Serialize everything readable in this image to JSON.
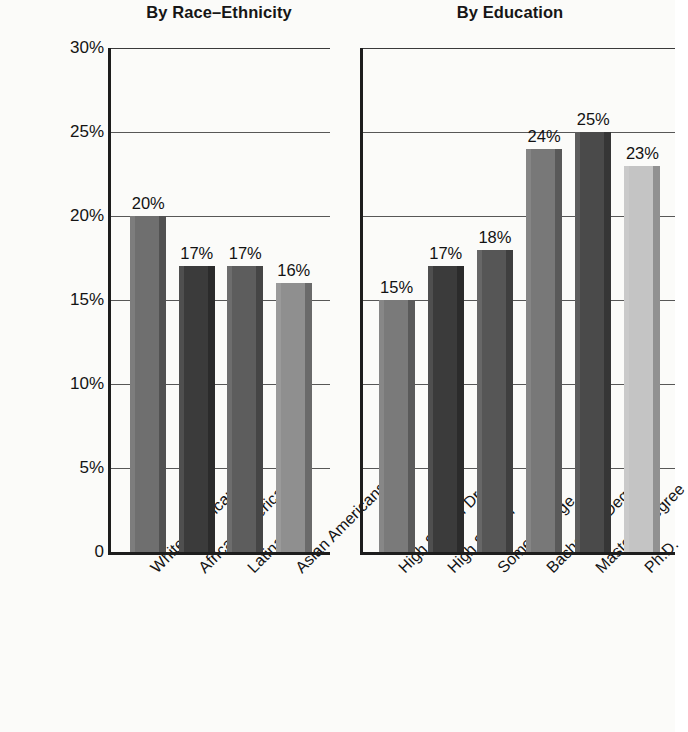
{
  "chart_data": [
    {
      "type": "bar",
      "title": "By Race–Ethnicity",
      "xlabel": "",
      "ylabel": "",
      "ylim": [
        0,
        30
      ],
      "grid": true,
      "legend": "none",
      "ytick_labels": [
        "0",
        "5%",
        "10%",
        "15%",
        "20%",
        "25%",
        "30%"
      ],
      "ytick_values": [
        0,
        5,
        10,
        15,
        20,
        25,
        30
      ],
      "categories": [
        "White Americans",
        "African Americans",
        "Latinas",
        "Asian Americans"
      ],
      "values": [
        20,
        17,
        17,
        16
      ],
      "value_labels": [
        "20%",
        "17%",
        "17%",
        "16%"
      ],
      "bar_colors": [
        "#6f6f6f",
        "#3b3b3b",
        "#5d5d5d",
        "#8f8f8f"
      ]
    },
    {
      "type": "bar",
      "title": "By Education",
      "xlabel": "",
      "ylabel": "",
      "ylim": [
        0,
        30
      ],
      "grid": true,
      "legend": "none",
      "ytick_labels": [
        "0",
        "5%",
        "10%",
        "15%",
        "20%",
        "25%",
        "30%"
      ],
      "ytick_values": [
        0,
        5,
        10,
        15,
        20,
        25,
        30
      ],
      "categories": [
        "High School Dropout",
        "High School",
        "Some College",
        "Bachelor's Degree",
        "Master's Degree",
        "Ph.D."
      ],
      "values": [
        15,
        17,
        18,
        24,
        25,
        23
      ],
      "value_labels": [
        "15%",
        "17%",
        "18%",
        "24%",
        "25%",
        "23%"
      ],
      "bar_colors": [
        "#7a7a7a",
        "#3b3b3b",
        "#565656",
        "#787878",
        "#4a4a4a",
        "#c4c4c4"
      ]
    }
  ],
  "axis": {
    "ticks": [
      {
        "label": "30%",
        "value": 30
      },
      {
        "label": "25%",
        "value": 25
      },
      {
        "label": "20%",
        "value": 20
      },
      {
        "label": "15%",
        "value": 15
      },
      {
        "label": "10%",
        "value": 10
      },
      {
        "label": "5%",
        "value": 5
      },
      {
        "label": "0",
        "value": 0
      }
    ]
  }
}
